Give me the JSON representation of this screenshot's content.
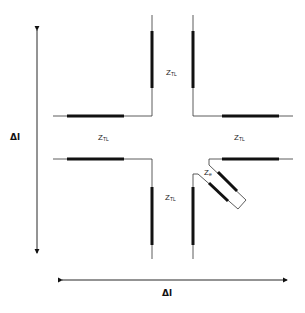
{
  "diagram": {
    "title": "",
    "type": "transmission-line junction",
    "labels": {
      "top": {
        "main": "Z",
        "sub": "TL"
      },
      "left": {
        "main": "Z",
        "sub": "TL"
      },
      "right": {
        "main": "Z",
        "sub": "TL"
      },
      "bottom": {
        "main": "Z",
        "sub": "TL"
      },
      "element": {
        "main": "Z",
        "sub": "e"
      }
    },
    "dimension_vertical": "Δl",
    "dimension_horizontal": "Δl",
    "colors": {
      "line": "#222222",
      "background": "#ffffff"
    }
  }
}
